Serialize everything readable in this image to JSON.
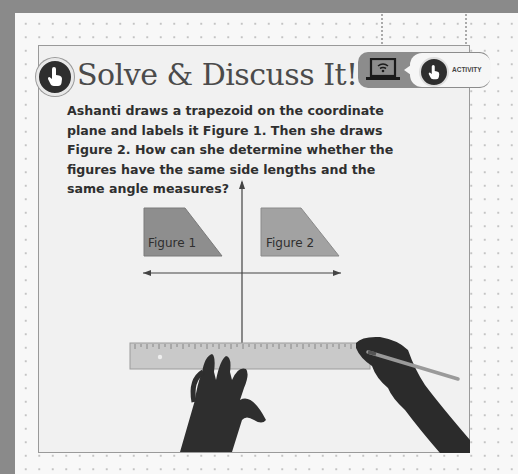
{
  "header": {
    "title": "Solve & Discuss It!",
    "title_icon": "pointing-hand-icon"
  },
  "badge": {
    "device_icon": "laptop-wifi-icon",
    "activity_icon": "pointing-hand-icon",
    "label": "ACTIVITY"
  },
  "question": "Ashanti draws a trapezoid on the coordinate plane and labels it Figure 1. Then she draws Figure 2. How can she determine whether the figures have the same side lengths and the same angle measures?",
  "figure": {
    "figure1_label": "Figure 1",
    "figure2_label": "Figure 2",
    "figure_fill": "#8e8e8e",
    "axes": "coordinate-axes",
    "illustration": "hands-holding-ruler-and-pencil"
  }
}
